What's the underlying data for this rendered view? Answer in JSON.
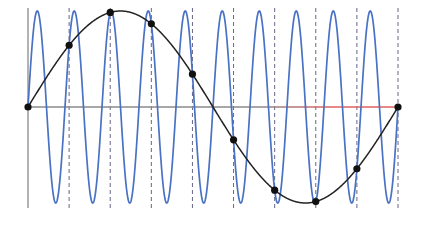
{
  "chart_data": {
    "type": "line",
    "title": "",
    "xlabel": "",
    "ylabel": "",
    "grid": false,
    "legend": null,
    "xlim": [
      0,
      9
    ],
    "ylim": [
      -1,
      1
    ],
    "sample_times": [
      0,
      1,
      2,
      3,
      4,
      5,
      6,
      7,
      8,
      9
    ],
    "series": [
      {
        "name": "high-frequency signal",
        "style": "line",
        "color": "#4a72c4",
        "cycles_over_range": 10,
        "amplitude": 1,
        "formula": "sin(2*pi*10*t/9)"
      },
      {
        "name": "alias signal",
        "style": "line",
        "color": "#222222",
        "cycles_over_range": 1,
        "amplitude": 1,
        "formula": "sin(2*pi*t/9)"
      },
      {
        "name": "samples",
        "style": "scatter",
        "color": "#111111",
        "x": [
          0,
          1,
          2,
          3,
          4,
          5,
          6,
          7,
          8,
          9
        ],
        "values": [
          0,
          0.643,
          0.985,
          0.866,
          0.342,
          -0.342,
          -0.866,
          -0.985,
          -0.643,
          0
        ]
      }
    ],
    "axes": {
      "x_axis_color_left": "#8a8a8a",
      "x_axis_color_right": "#e06060",
      "y_axis_color": "#9a9a9a",
      "sample_line_color": "#666688",
      "sample_line_style": "dashed"
    }
  }
}
